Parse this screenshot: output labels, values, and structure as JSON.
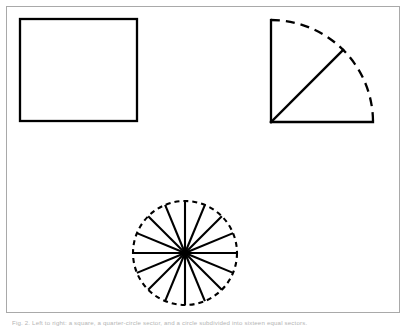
{
  "figure": {
    "background_color": "#ffffff",
    "frame": {
      "name": "figure-border",
      "stroke_color": "#a9a9a9",
      "stroke_width": 1,
      "x": 6,
      "y": 6,
      "width": 394,
      "height": 307
    },
    "stroke_color": "#000000",
    "caption": "Fig. 2. Left to right: a square, a quarter-circle sector, and a circle subdivided into sixteen equal sectors.",
    "shapes": [
      {
        "name": "square-outline",
        "kind": "square",
        "label": "square",
        "x": 20,
        "y": 19,
        "width": 117,
        "height": 102,
        "stroke_width": 2.3,
        "stroke_style": "solid",
        "fill": "none"
      },
      {
        "name": "quarter-circle-sector",
        "kind": "circular-sector",
        "label": "quarter circle",
        "center_x": 271,
        "center_y": 122,
        "radius": 102,
        "start_angle_deg": 0,
        "end_angle_deg": 90,
        "arc_stroke_style": "dashed",
        "arc_dash_pattern": "9 6",
        "radii_stroke_style": "solid",
        "stroke_width": 2.3,
        "bisector_angle_deg": 45,
        "bisector_present": true,
        "fill": "none"
      },
      {
        "name": "subdivided-circle",
        "kind": "circle-with-spokes",
        "label": "circle divided into sectors",
        "center_x": 185,
        "center_y": 253,
        "radius": 52,
        "outline_stroke_style": "dashed",
        "outline_dash_pattern": "5 4",
        "spoke_count": 16,
        "spoke_step_deg": 22.5,
        "spoke_stroke_style": "solid",
        "stroke_width": 2.1,
        "fill": "none"
      }
    ]
  }
}
